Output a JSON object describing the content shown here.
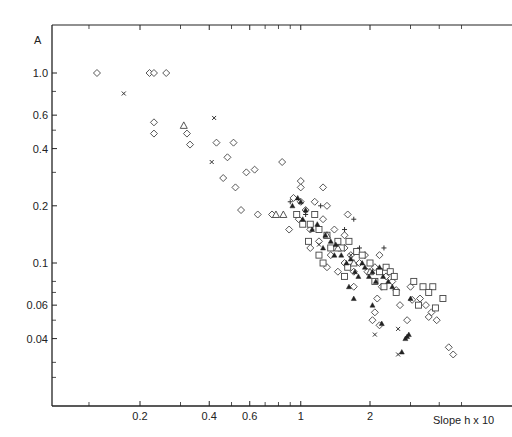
{
  "chart_data": {
    "type": "scatter",
    "title": "",
    "ylabel": "A",
    "xlabel": "Slope h x 10",
    "xscale": "log",
    "yscale": "log",
    "xlim": [
      0.1,
      5.5
    ],
    "ylim": [
      0.02,
      1.6
    ],
    "grid": false,
    "legend": "none",
    "x_ticks": [
      {
        "value": 0.2,
        "label": "0.2"
      },
      {
        "value": 0.4,
        "label": "0.4"
      },
      {
        "value": 0.6,
        "label": "0.6"
      },
      {
        "value": 1,
        "label": "1"
      },
      {
        "value": 2,
        "label": "2"
      }
    ],
    "y_ticks": [
      {
        "value": 1.0,
        "label": "1.0"
      },
      {
        "value": 0.6,
        "label": "0.6"
      },
      {
        "value": 0.4,
        "label": "0.4"
      },
      {
        "value": 0.2,
        "label": "0.2"
      },
      {
        "value": 0.1,
        "label": "0.1"
      },
      {
        "value": 0.06,
        "label": "0.06"
      },
      {
        "value": 0.04,
        "label": "0.04"
      }
    ],
    "series": [
      {
        "name": "open-diamond",
        "marker": "diamond-open",
        "points": [
          [
            0.13,
            1.0
          ],
          [
            0.22,
            1.0
          ],
          [
            0.23,
            1.0
          ],
          [
            0.26,
            1.0
          ],
          [
            0.23,
            0.55
          ],
          [
            0.23,
            0.48
          ],
          [
            0.32,
            0.48
          ],
          [
            0.33,
            0.42
          ],
          [
            0.43,
            0.43
          ],
          [
            0.51,
            0.43
          ],
          [
            0.48,
            0.36
          ],
          [
            0.46,
            0.28
          ],
          [
            0.52,
            0.25
          ],
          [
            0.58,
            0.3
          ],
          [
            0.63,
            0.31
          ],
          [
            0.55,
            0.19
          ],
          [
            0.65,
            0.18
          ],
          [
            0.83,
            0.34
          ],
          [
            0.75,
            0.18
          ],
          [
            0.89,
            0.15
          ],
          [
            1.0,
            0.27
          ],
          [
            1.0,
            0.25
          ],
          [
            0.93,
            0.22
          ],
          [
            1.25,
            0.25
          ],
          [
            1.15,
            0.21
          ],
          [
            1.05,
            0.19
          ],
          [
            0.98,
            0.17
          ],
          [
            1.3,
            0.2
          ],
          [
            1.25,
            0.17
          ],
          [
            1.6,
            0.18
          ],
          [
            1.55,
            0.14
          ],
          [
            1.4,
            0.15
          ],
          [
            1.2,
            0.13
          ],
          [
            1.1,
            0.12
          ],
          [
            1.35,
            0.11
          ],
          [
            1.55,
            0.12
          ],
          [
            1.65,
            0.11
          ],
          [
            1.9,
            0.11
          ],
          [
            1.8,
            0.1
          ],
          [
            1.45,
            0.09
          ],
          [
            1.7,
            0.09
          ],
          [
            1.3,
            0.095
          ],
          [
            1.95,
            0.09
          ],
          [
            2.2,
            0.11
          ],
          [
            2.1,
            0.095
          ],
          [
            2.35,
            0.085
          ],
          [
            2.5,
            0.08
          ],
          [
            2.25,
            0.075
          ],
          [
            1.7,
            0.075
          ],
          [
            2.15,
            0.065
          ],
          [
            2.6,
            0.072
          ],
          [
            3.0,
            0.075
          ],
          [
            3.3,
            0.065
          ],
          [
            3.5,
            0.06
          ],
          [
            3.7,
            0.055
          ],
          [
            3.9,
            0.05
          ],
          [
            2.7,
            0.06
          ],
          [
            2.9,
            0.05
          ],
          [
            3.05,
            0.064
          ],
          [
            2.05,
            0.05
          ],
          [
            2.1,
            0.055
          ],
          [
            2.2,
            0.047
          ],
          [
            3.6,
            0.052
          ],
          [
            4.4,
            0.036
          ],
          [
            4.6,
            0.033
          ],
          [
            1.55,
            0.1
          ],
          [
            1.0,
            0.21
          ],
          [
            1.1,
            0.15
          ]
        ]
      },
      {
        "name": "open-square",
        "marker": "square-open",
        "points": [
          [
            0.96,
            0.18
          ],
          [
            1.02,
            0.16
          ],
          [
            1.1,
            0.16
          ],
          [
            1.2,
            0.15
          ],
          [
            1.15,
            0.18
          ],
          [
            1.3,
            0.14
          ],
          [
            1.45,
            0.13
          ],
          [
            1.5,
            0.12
          ],
          [
            1.35,
            0.12
          ],
          [
            1.62,
            0.13
          ],
          [
            1.75,
            0.115
          ],
          [
            1.85,
            0.11
          ],
          [
            1.25,
            0.1
          ],
          [
            1.6,
            0.095
          ],
          [
            2.0,
            0.1
          ],
          [
            2.2,
            0.09
          ],
          [
            2.35,
            0.095
          ],
          [
            2.45,
            0.09
          ],
          [
            2.55,
            0.085
          ],
          [
            2.1,
            0.08
          ],
          [
            2.3,
            0.075
          ],
          [
            3.1,
            0.08
          ],
          [
            3.4,
            0.075
          ],
          [
            3.75,
            0.075
          ],
          [
            3.25,
            0.06
          ],
          [
            3.6,
            0.07
          ],
          [
            4.15,
            0.065
          ],
          [
            3.85,
            0.058
          ],
          [
            2.6,
            0.07
          ],
          [
            1.55,
            0.085
          ],
          [
            1.2,
            0.11
          ],
          [
            1.08,
            0.13
          ]
        ]
      },
      {
        "name": "open-triangle",
        "marker": "triangle-open",
        "points": [
          [
            0.31,
            0.53
          ],
          [
            0.78,
            0.18
          ],
          [
            0.84,
            0.18
          ],
          [
            1.45,
            0.12
          ],
          [
            1.7,
            0.1
          ],
          [
            2.0,
            0.09
          ],
          [
            1.3,
            0.14
          ]
        ]
      },
      {
        "name": "cross",
        "marker": "x",
        "points": [
          [
            0.17,
            0.78
          ],
          [
            0.42,
            0.58
          ],
          [
            0.41,
            0.34
          ],
          [
            2.65,
            0.045
          ],
          [
            2.1,
            0.042
          ],
          [
            2.65,
            0.033
          ],
          [
            1.65,
            0.11
          ],
          [
            1.2,
            0.125
          ]
        ]
      },
      {
        "name": "plus",
        "marker": "plus",
        "points": [
          [
            0.9,
            0.21
          ],
          [
            1.22,
            0.2
          ],
          [
            1.7,
            0.17
          ],
          [
            1.55,
            0.15
          ],
          [
            2.3,
            0.12
          ],
          [
            1.05,
            0.18
          ],
          [
            1.8,
            0.12
          ]
        ]
      },
      {
        "name": "filled",
        "marker": "triangle-filled",
        "points": [
          [
            0.92,
            0.2
          ],
          [
            0.97,
            0.22
          ],
          [
            1.0,
            0.21
          ],
          [
            1.05,
            0.19
          ],
          [
            1.02,
            0.17
          ],
          [
            1.12,
            0.15
          ],
          [
            1.18,
            0.16
          ],
          [
            1.28,
            0.14
          ],
          [
            1.35,
            0.13
          ],
          [
            1.42,
            0.125
          ],
          [
            1.5,
            0.11
          ],
          [
            1.58,
            0.1
          ],
          [
            1.65,
            0.105
          ],
          [
            1.72,
            0.09
          ],
          [
            1.78,
            0.085
          ],
          [
            1.85,
            0.1
          ],
          [
            1.9,
            0.095
          ],
          [
            1.98,
            0.085
          ],
          [
            2.05,
            0.09
          ],
          [
            2.12,
            0.08
          ],
          [
            2.2,
            0.095
          ],
          [
            2.28,
            0.085
          ],
          [
            2.4,
            0.08
          ],
          [
            1.7,
            0.065
          ],
          [
            2.05,
            0.06
          ],
          [
            2.25,
            0.048
          ],
          [
            2.85,
            0.04
          ],
          [
            2.9,
            0.041
          ],
          [
            2.95,
            0.042
          ],
          [
            2.75,
            0.034
          ],
          [
            3.0,
            0.065
          ],
          [
            1.25,
            0.12
          ],
          [
            1.4,
            0.11
          ],
          [
            1.62,
            0.075
          ],
          [
            2.5,
            0.075
          ]
        ]
      }
    ]
  }
}
